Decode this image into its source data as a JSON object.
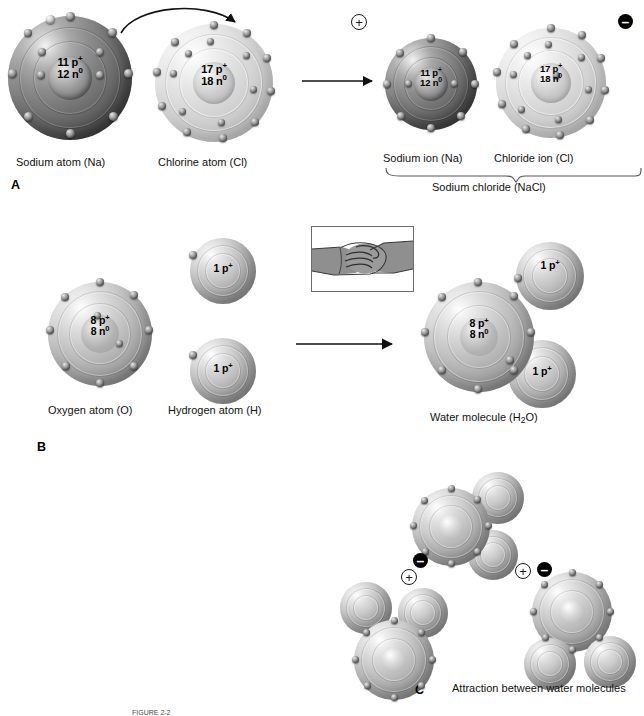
{
  "figure": {
    "caption_partial": "FIGURE 2-2",
    "panels": [
      {
        "letter": "A",
        "topic": "ionic-bond"
      },
      {
        "letter": "B",
        "topic": "covalent-bond"
      },
      {
        "letter": "C",
        "topic": "hydrogen-bond"
      }
    ]
  },
  "panelA": {
    "letter": "A",
    "sodium_atom": {
      "label": "Sodium atom (Na)",
      "protons": "11 p",
      "protons_sup": "+",
      "neutrons": "12 n",
      "neutrons_sup": "0",
      "electrons": 11,
      "shell_counts": [
        2,
        8,
        1
      ]
    },
    "chlorine_atom": {
      "label": "Chlorine atom (Cl)",
      "protons": "17 p",
      "protons_sup": "+",
      "neutrons": "18 n",
      "neutrons_sup": "0",
      "electrons": 17,
      "shell_counts": [
        2,
        8,
        7
      ]
    },
    "sodium_ion": {
      "label": "Sodium ion (Na)",
      "protons": "11 p",
      "protons_sup": "+",
      "neutrons": "12 n",
      "neutrons_sup": "0",
      "charge": "+",
      "electrons": 10
    },
    "chloride_ion": {
      "label": "Chloride ion (Cl)",
      "protons": "17 p",
      "protons_sup": "+",
      "neutrons": "18 n",
      "neutrons_sup": "0",
      "charge": "–",
      "electrons": 18
    },
    "product_label": "Sodium chloride (NaCl)",
    "transfer_note": "electron transferred from sodium to chlorine"
  },
  "panelB": {
    "letter": "B",
    "oxygen_atom": {
      "label": "Oxygen atom (O)",
      "protons": "8 p",
      "protons_sup": "+",
      "neutrons": "8 n",
      "neutrons_sup": "0",
      "electrons": 8
    },
    "hydrogen_atom": {
      "label": "Hydrogen atom (H)",
      "protons": "1 p",
      "protons_sup": "+",
      "count": 2
    },
    "product": {
      "label": "Water molecule (H",
      "label_sub": "2",
      "label_tail": "O)"
    },
    "inset": {
      "name": "handshake-illustration",
      "meaning": "shared electrons"
    }
  },
  "panelC": {
    "letter": "C",
    "label": "Attraction between water molecules",
    "charges": [
      {
        "sign": "–",
        "kind": "negative"
      },
      {
        "sign": "+",
        "kind": "positive"
      },
      {
        "sign": "+",
        "kind": "positive"
      },
      {
        "sign": "–",
        "kind": "negative"
      }
    ],
    "molecule_count": 3
  },
  "colors": {
    "background": "#ffffff",
    "text": "#111111",
    "negative_badge": "#000000",
    "positive_badge_border": "#1a1a1a",
    "arrow": "#111111",
    "inset_border": "#6b6b6b"
  }
}
